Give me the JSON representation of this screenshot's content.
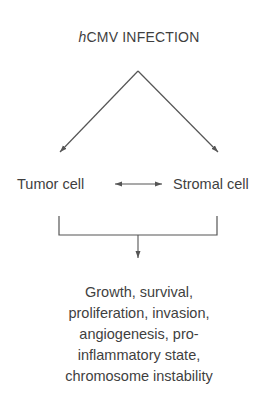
{
  "diagram": {
    "title_prefix": "h",
    "title_rest": "CMV INFECTION",
    "nodes": {
      "tumor_cell": "Tumor cell",
      "stromal_cell": "Stromal cell"
    },
    "outcome_lines": [
      "Growth, survival,",
      "proliferation, invasion,",
      "angiogenesis, pro-",
      "inflammatory state,",
      "chromosome instability"
    ],
    "edges": [
      {
        "from": "hCMV INFECTION",
        "to": "Tumor cell",
        "type": "arrow"
      },
      {
        "from": "hCMV INFECTION",
        "to": "Stromal cell",
        "type": "arrow"
      },
      {
        "from": "Tumor cell",
        "to": "Stromal cell",
        "type": "bidirectional-arrow"
      },
      {
        "from": "Tumor cell + Stromal cell",
        "to": "outcomes",
        "type": "bracket-arrow"
      }
    ],
    "colors": {
      "line": "#555555",
      "text": "#3f3f3f"
    }
  }
}
